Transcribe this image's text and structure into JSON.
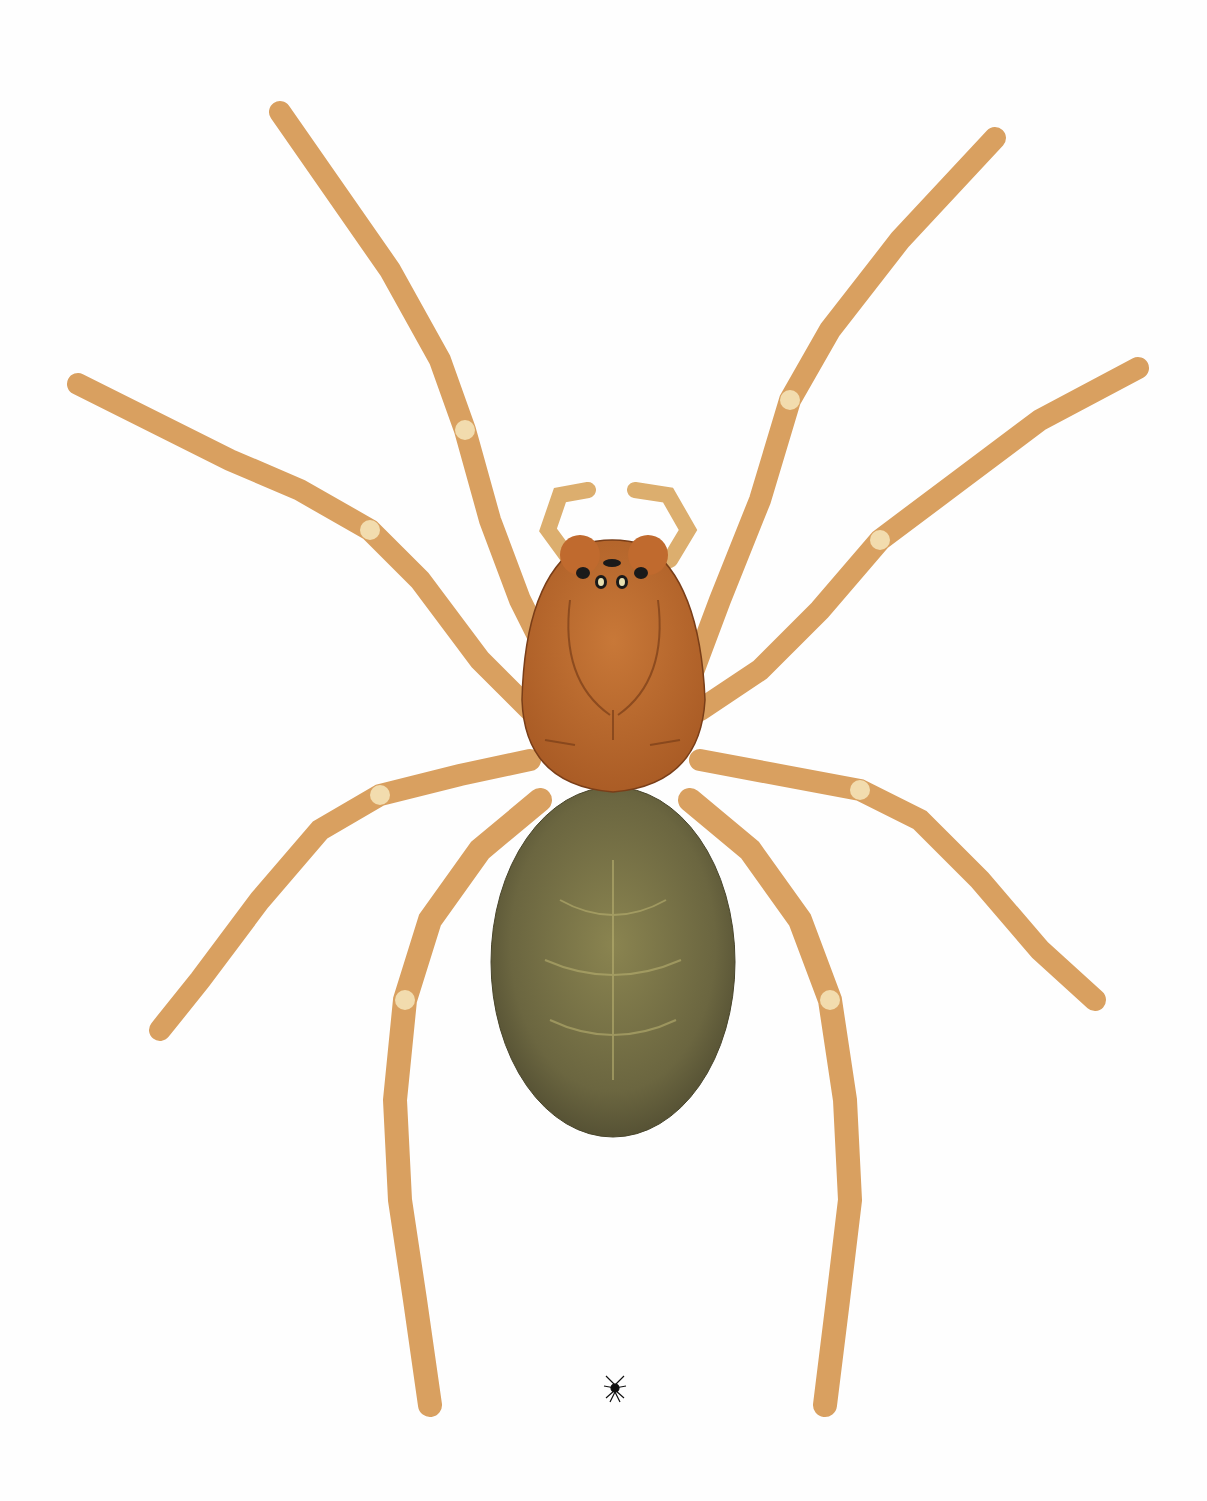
{
  "illustration": {
    "subject": "spider",
    "view": "dorsal",
    "background_color": "#fefefe",
    "leg_color": "#dca566",
    "leg_light_color": "#f0d6a4",
    "carapace_color": "#c06a2e",
    "abdomen_color": "#6e6a44",
    "scale_icon": "spider-scale-icon"
  }
}
